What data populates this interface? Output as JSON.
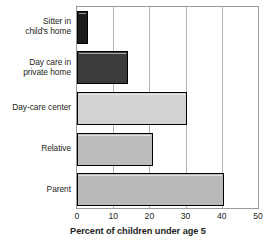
{
  "chart_data": {
    "type": "bar",
    "orientation": "horizontal",
    "title": "",
    "xlabel": "Percent of children under age 5",
    "ylabel": "",
    "xlim": [
      0,
      50
    ],
    "xticks": [
      0,
      10,
      20,
      30,
      40,
      50
    ],
    "xtick_labels": [
      "0",
      "10",
      "20",
      "30",
      "40",
      "50"
    ],
    "grid": true,
    "grid_axis": "x",
    "legend": "none",
    "categories": [
      "Sitter in child's home",
      "Day care in private home",
      "Day-care center",
      "Relative",
      "Parent"
    ],
    "values": [
      3,
      14,
      30.5,
      21,
      40.5
    ],
    "bar_colors": [
      "#1c1c1c",
      "#3b3b3b",
      "#d2d2d2",
      "#bcbcbc",
      "#b9b9b9"
    ],
    "bar_border_color": "#000000",
    "axis_color": "#9a9a9a",
    "gridline_color": "#b4b4b4",
    "background_color": "#ffffff",
    "text_color": "#231f20"
  },
  "bars": [
    {
      "name": "sitter-in-childs-home",
      "label_lines": [
        "Sitter in",
        "child's home"
      ],
      "value": 3,
      "color": "#1c1c1c"
    },
    {
      "name": "day-care-in-private-home",
      "label_lines": [
        "Day care in",
        "private home"
      ],
      "value": 14,
      "color": "#3b3b3b"
    },
    {
      "name": "day-care-center",
      "label_lines": [
        "Day-care center"
      ],
      "value": 30.5,
      "color": "#d2d2d2"
    },
    {
      "name": "relative",
      "label_lines": [
        "Relative"
      ],
      "value": 21,
      "color": "#bcbcbc"
    },
    {
      "name": "parent",
      "label_lines": [
        "Parent"
      ],
      "value": 40.5,
      "color": "#b9b9b9"
    }
  ],
  "axis": {
    "x_title": "Percent of children under age 5",
    "x_tick_labels": [
      "0",
      "10",
      "20",
      "30",
      "40",
      "50"
    ]
  }
}
